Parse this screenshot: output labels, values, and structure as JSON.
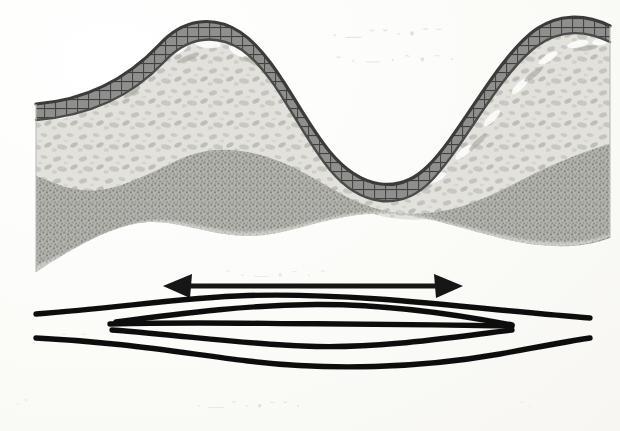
{
  "figure": {
    "background_color": "#fdfdfb",
    "width": 620,
    "height": 431
  },
  "cross_section": {
    "name": "folded-strata-cross-section",
    "bounds": {
      "left": 36,
      "right": 610,
      "top": 14,
      "bottom": 272
    },
    "layers": [
      {
        "id": "competent-hatched-bed",
        "label": "Competent hatched bed",
        "fill_color": "#8d8d8d",
        "stroke_color": "#4a4a4a",
        "pattern": "ruled-hatch",
        "thickness_px": 16,
        "description": "Dark ruled/brick-patterned stiff layer draped over the fold crest and trough"
      },
      {
        "id": "mottled-light-bed",
        "label": "Mottled light bed",
        "fill_color": "#dcdcd6",
        "pattern": "mottled-clast",
        "description": "Light speckled incompetent layer below the hatched bed"
      },
      {
        "id": "stippled-medium-bed",
        "label": "Stippled medium bed",
        "fill_color": "#a8a8a2",
        "pattern": "fine-stipple",
        "description": "Medium grey stippled basal layer"
      }
    ],
    "fold_geometry": {
      "type": "sinusoidal",
      "anticline_crest_x": 196,
      "syncline_trough_x": 392,
      "right_crest_x": 556,
      "amplitude_px": 52,
      "wavelength_px": 392
    }
  },
  "strain_arrow": {
    "name": "extension-direction-arrow",
    "type": "double-headed-horizontal",
    "color": "#141414",
    "x1": 163,
    "x2": 463,
    "y": 286,
    "shaft_thickness_px": 5,
    "head_length_px": 26,
    "head_half_width_px": 12,
    "meaning": "Direction of layer-parallel extension"
  },
  "boudin_lens": {
    "name": "boudinage-lens-diagram",
    "color": "#101010",
    "line_count": 5,
    "description": "Five stacked curved traces forming a lens, the inner traces pinched to shorter lengths",
    "lines": [
      {
        "id": "line-1-outer-top",
        "x_start": 36,
        "x_end": 590,
        "y_end_left": 314,
        "y_end_right": 318,
        "y_center": 296,
        "thickness_px": 5,
        "bow": "up"
      },
      {
        "id": "line-2-inner-top",
        "x_start": 116,
        "x_end": 512,
        "y_end_left": 322,
        "y_end_right": 325,
        "y_center": 305,
        "thickness_px": 5,
        "bow": "up"
      },
      {
        "id": "line-3-median",
        "x_start": 110,
        "x_end": 512,
        "y_end_left": 324,
        "y_end_right": 326,
        "y_center": 324,
        "thickness_px": 5,
        "bow": "flat"
      },
      {
        "id": "line-4-inner-bottom",
        "x_start": 112,
        "x_end": 512,
        "y_end_left": 330,
        "y_end_right": 330,
        "y_center": 347,
        "thickness_px": 5,
        "bow": "down"
      },
      {
        "id": "line-5-outer-bottom",
        "x_start": 36,
        "x_end": 590,
        "y_end_left": 338,
        "y_end_right": 338,
        "y_center": 366,
        "thickness_px": 5,
        "bow": "down"
      }
    ]
  },
  "ghost_text": {
    "name": "scan-bleed-through",
    "description": "Illegible bleed-through text from the reverse side of the scanned page",
    "fragments": [
      "· — ˜ ˘ · • ˜ ˉ",
      "˘ · — · ˜ • ˉ ·",
      "· ˜ · •",
      "˜ · — • ˉ · ˜",
      "˘ · ˜",
      "· — ˜ · • ˉ ˘ ·",
      "· ˜",
      "ˉ ·",
      "· ˜ ·"
    ]
  }
}
